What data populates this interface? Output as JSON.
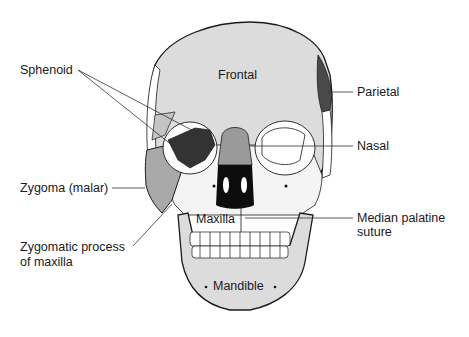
{
  "diagram": {
    "title": "",
    "colors": {
      "light_bone": "#dcdcdc",
      "mid_gray": "#a9a9a9",
      "dark_gray": "#3a3a3a",
      "white_bone": "#ffffff",
      "outline": "#1a1a1a",
      "leader": "#333333"
    },
    "labels": {
      "sphenoid": "Sphenoid",
      "parietal": "Parietal",
      "nasal": "Nasal",
      "zygoma": "Zygoma (malar)",
      "median_palatine_1": "Median palatine",
      "median_palatine_2": "suture",
      "zygomatic_process_1": "Zygomatic process",
      "zygomatic_process_2": "of maxilla",
      "frontal": "Frontal",
      "maxilla": "Maxilla",
      "mandible": "Mandible"
    }
  }
}
